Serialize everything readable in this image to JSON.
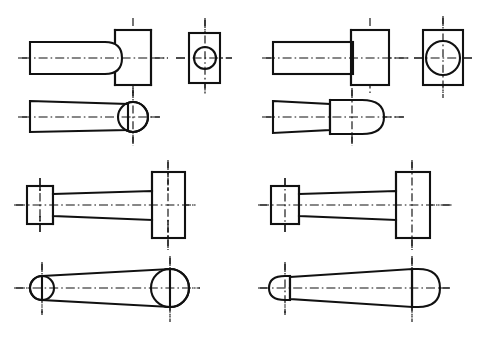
{
  "sheet": {
    "title": "Orthographic views of four shaft-and-head machine parts",
    "width": 480,
    "height": 337,
    "background_color": "#ffffff",
    "line_color": "#111111",
    "line_style_note": "black line art with dash-dot centerlines"
  },
  "figures": [
    {
      "id": "fig-top-left",
      "name": "round-shaft-with-rectangular-head-filleted",
      "label": "",
      "quadrant": "top-left",
      "views": [
        {
          "id": "tl-front",
          "name": "front-elevation",
          "description": "round shaft with rounded fillet blending into rectangular head"
        },
        {
          "id": "tl-end",
          "name": "end-view",
          "description": "rectangle with small centered circle"
        },
        {
          "id": "tl-plan",
          "name": "plan-view",
          "description": "parallel-sided shaft terminating in a circle"
        }
      ]
    },
    {
      "id": "fig-top-right",
      "name": "round-shaft-with-rectangular-head-square-shoulder",
      "label": "",
      "quadrant": "top-right",
      "views": [
        {
          "id": "tr-front",
          "name": "front-elevation",
          "description": "round shaft meeting rectangular head at a square shoulder"
        },
        {
          "id": "tr-end",
          "name": "end-view",
          "description": "rectangle with large centered circle"
        },
        {
          "id": "tr-plan",
          "name": "plan-view",
          "description": "shaft with wider boss ending in a domed cap"
        }
      ]
    },
    {
      "id": "fig-bottom-left",
      "name": "connecting-rod-small-boss-large-head-hidden-detail",
      "label": "",
      "quadrant": "bottom-left",
      "views": [
        {
          "id": "bl-front",
          "name": "front-elevation",
          "description": "small square boss, long tapered web, tall rectangular head with hidden bore lines"
        },
        {
          "id": "bl-plan",
          "name": "plan-view",
          "description": "small circle joined by tapered sides to large circle"
        }
      ]
    },
    {
      "id": "fig-bottom-right",
      "name": "connecting-rod-small-boss-large-head-solid",
      "label": "",
      "quadrant": "bottom-right",
      "views": [
        {
          "id": "br-front",
          "name": "front-elevation",
          "description": "small square boss, long tapered web, tall rectangular head without bore"
        },
        {
          "id": "br-plan",
          "name": "plan-view",
          "description": "small rounded cap joined by tapered sides to large rounded cap"
        }
      ]
    }
  ]
}
